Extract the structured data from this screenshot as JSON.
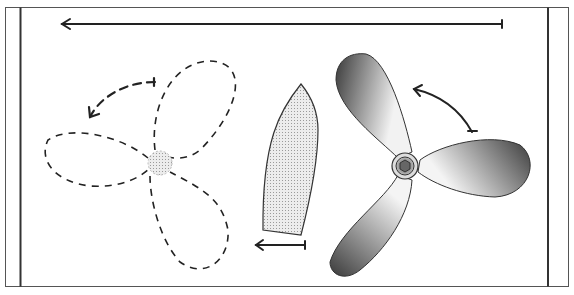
{
  "diagram": {
    "title": "",
    "colors": {
      "frame": "#555555",
      "rail": "#333333",
      "stroke": "#1a1a1a",
      "dashed_stroke": "#222222",
      "hull_fill": "#d9d9d9",
      "blade_dark": "#3a3a3a",
      "blade_light": "#f2f2f2",
      "hub_fill": "#9a9a9a",
      "background": "#ffffff"
    },
    "elements": {
      "top_arrow": {
        "direction": "left"
      },
      "ghost_propeller": {
        "blades": 3,
        "style": "dashed"
      },
      "ghost_rotation_arrow": {
        "direction": "counter-clockwise"
      },
      "boat_hull": {
        "orientation": "bow-up"
      },
      "hull_arrow": {
        "direction": "left"
      },
      "propeller": {
        "blades": 3,
        "style": "shaded"
      },
      "propeller_rotation_arrow": {
        "direction": "counter-clockwise"
      }
    }
  }
}
